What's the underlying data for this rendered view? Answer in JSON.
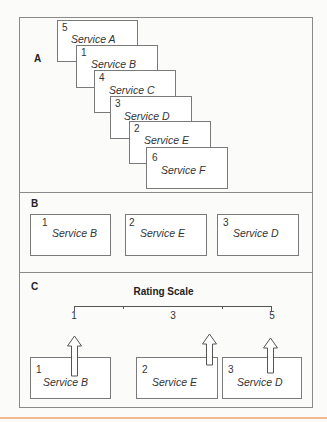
{
  "sections": {
    "a": {
      "label": "A",
      "cards": [
        {
          "num": "5",
          "name": "Service A"
        },
        {
          "num": "1",
          "name": "Service B"
        },
        {
          "num": "4",
          "name": "Service C"
        },
        {
          "num": "3",
          "name": "Service D"
        },
        {
          "num": "2",
          "name": "Service E"
        },
        {
          "num": "6",
          "name": "Service F"
        }
      ]
    },
    "b": {
      "label": "B",
      "cards": [
        {
          "num": "1",
          "name": "Service B"
        },
        {
          "num": "2",
          "name": "Service E"
        },
        {
          "num": "3",
          "name": "Service D"
        }
      ]
    },
    "c": {
      "label": "C",
      "scale": {
        "title": "Rating Scale",
        "labels": [
          "1",
          "3",
          "5"
        ],
        "min": 1,
        "max": 5
      },
      "cards": [
        {
          "num": "1",
          "name": "Service B",
          "rating": 1
        },
        {
          "num": "2",
          "name": "Service E",
          "rating": 3.75
        },
        {
          "num": "3",
          "name": "Service D",
          "rating": 4.95
        }
      ]
    }
  },
  "colors": {
    "line": "#8a8a8a",
    "accent_bottom": "#f2b98f"
  }
}
